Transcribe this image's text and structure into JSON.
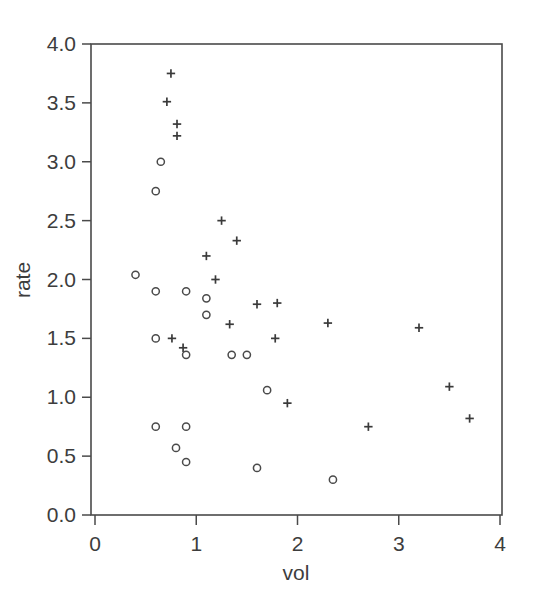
{
  "chart_data": {
    "type": "scatter",
    "title": "",
    "xlabel": "vol",
    "ylabel": "rate",
    "xlim": [
      0,
      4
    ],
    "ylim": [
      0,
      4
    ],
    "grid": false,
    "legend": null,
    "x_ticks": [
      "0",
      "1",
      "2",
      "3",
      "4"
    ],
    "x_tick_values": [
      0,
      1,
      2,
      3,
      4
    ],
    "y_ticks": [
      "0.0",
      "0.5",
      "1.0",
      "1.5",
      "2.0",
      "2.5",
      "3.0",
      "3.5",
      "4.0"
    ],
    "y_tick_values": [
      0.0,
      0.5,
      1.0,
      1.5,
      2.0,
      2.5,
      3.0,
      3.5,
      4.0
    ],
    "series": [
      {
        "name": "plus-group",
        "marker": "plus",
        "color": "#3a3a3a",
        "points": [
          [
            0.75,
            3.75
          ],
          [
            0.71,
            3.51
          ],
          [
            0.81,
            3.32
          ],
          [
            0.81,
            3.22
          ],
          [
            1.25,
            2.5
          ],
          [
            1.4,
            2.33
          ],
          [
            1.1,
            2.2
          ],
          [
            1.19,
            2.0
          ],
          [
            0.76,
            1.5
          ],
          [
            0.87,
            1.42
          ],
          [
            1.33,
            1.62
          ],
          [
            1.6,
            1.79
          ],
          [
            1.8,
            1.8
          ],
          [
            1.78,
            1.5
          ],
          [
            1.9,
            0.95
          ],
          [
            2.3,
            1.63
          ],
          [
            2.7,
            0.75
          ],
          [
            3.2,
            1.59
          ],
          [
            3.5,
            1.09
          ],
          [
            3.7,
            0.82
          ]
        ]
      },
      {
        "name": "circle-group",
        "marker": "circle",
        "color": "#4a4a4a",
        "points": [
          [
            0.4,
            2.04
          ],
          [
            0.6,
            1.9
          ],
          [
            0.9,
            1.9
          ],
          [
            1.1,
            1.84
          ],
          [
            1.1,
            1.7
          ],
          [
            0.6,
            1.5
          ],
          [
            0.9,
            1.36
          ],
          [
            1.35,
            1.36
          ],
          [
            1.5,
            1.36
          ],
          [
            0.65,
            3.0
          ],
          [
            0.6,
            2.75
          ],
          [
            0.6,
            0.75
          ],
          [
            0.9,
            0.75
          ],
          [
            0.8,
            0.57
          ],
          [
            0.9,
            0.45
          ],
          [
            1.6,
            0.4
          ],
          [
            1.7,
            1.06
          ],
          [
            2.35,
            0.3
          ]
        ]
      }
    ]
  },
  "axes": {
    "x_title": "vol",
    "y_title": "rate"
  }
}
